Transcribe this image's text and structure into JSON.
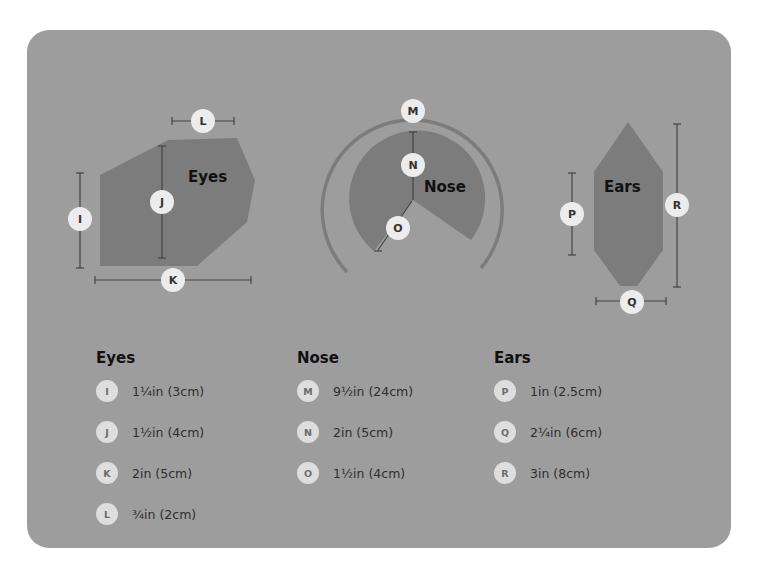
{
  "shapes": {
    "eyes": {
      "label": "Eyes"
    },
    "nose": {
      "label": "Nose"
    },
    "ears": {
      "label": "Ears"
    }
  },
  "badges": {
    "I": "I",
    "J": "J",
    "K": "K",
    "L": "L",
    "M": "M",
    "N": "N",
    "O": "O",
    "P": "P",
    "Q": "Q",
    "R": "R"
  },
  "legend": {
    "eyes": {
      "title": "Eyes",
      "items": [
        {
          "key": "I",
          "value": "1¼in (3cm)"
        },
        {
          "key": "J",
          "value": "1½in (4cm)"
        },
        {
          "key": "K",
          "value": "2in (5cm)"
        },
        {
          "key": "L",
          "value": "¾in (2cm)"
        }
      ]
    },
    "nose": {
      "title": "Nose",
      "items": [
        {
          "key": "M",
          "value": "9½in (24cm)"
        },
        {
          "key": "N",
          "value": "2in (5cm)"
        },
        {
          "key": "O",
          "value": "1½in (4cm)"
        }
      ]
    },
    "ears": {
      "title": "Ears",
      "items": [
        {
          "key": "P",
          "value": "1in (2.5cm)"
        },
        {
          "key": "Q",
          "value": "2¼in (6cm)"
        },
        {
          "key": "R",
          "value": "3in (8cm)"
        }
      ]
    }
  },
  "colors": {
    "card": "#9d9d9d",
    "shape": "#7c7c7c",
    "badge": "#ececec"
  }
}
